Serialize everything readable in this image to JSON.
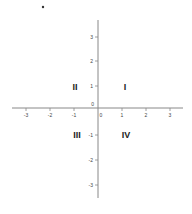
{
  "diagram": {
    "type": "coordinate-plane",
    "origin_label": "0",
    "x_ticks": [
      "-3",
      "-2",
      "-1",
      "0",
      "1",
      "2",
      "3"
    ],
    "y_ticks": [
      "3",
      "2",
      "1",
      "-1",
      "-2",
      "-3"
    ],
    "quadrants": {
      "I": "I",
      "II": "II",
      "III": "III",
      "IV": "IV"
    },
    "colors": {
      "axis": "#888888",
      "label": "#222222"
    }
  }
}
